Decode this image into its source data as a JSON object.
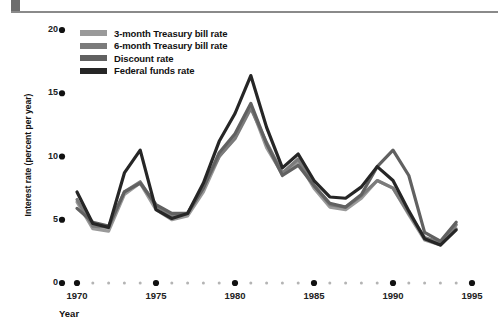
{
  "header": {
    "rule_color": "#8a8a8a",
    "block_color": "#6d6d6d"
  },
  "chart_data": {
    "type": "line",
    "title": "",
    "subtitle": "",
    "xlabel": "Year",
    "ylabel": "Interest rate (percent per year)",
    "xlim": [
      1969,
      1996
    ],
    "ylim": [
      0,
      20
    ],
    "ytick_labels": [
      "0",
      "5",
      "10",
      "15",
      "20"
    ],
    "ytick_values": [
      0,
      5,
      10,
      15,
      20
    ],
    "xtick_labels": [
      "1970",
      "1975",
      "1980",
      "1985",
      "1990",
      "1995"
    ],
    "xtick_values": [
      1970,
      1975,
      1980,
      1985,
      1990,
      1995
    ],
    "minor_xticks": [
      1971,
      1972,
      1973,
      1974,
      1976,
      1977,
      1978,
      1979,
      1981,
      1982,
      1983,
      1984,
      1986,
      1987,
      1988,
      1989,
      1991,
      1992,
      1993,
      1994
    ],
    "grid": false,
    "legend_position": "upper-left",
    "x": [
      1970,
      1971,
      1972,
      1973,
      1974,
      1975,
      1976,
      1977,
      1978,
      1979,
      1980,
      1981,
      1982,
      1983,
      1984,
      1985,
      1986,
      1987,
      1988,
      1989,
      1990,
      1991,
      1992,
      1993,
      1994
    ],
    "series": [
      {
        "name": "3-month Treasury bill rate",
        "color": "#9a9a9a",
        "values": [
          6.4,
          4.3,
          4.1,
          7.0,
          7.9,
          5.8,
          5.0,
          5.3,
          7.2,
          10.0,
          11.5,
          14.0,
          10.7,
          8.6,
          9.6,
          7.5,
          6.0,
          5.8,
          6.7,
          8.1,
          7.5,
          5.4,
          3.4,
          3.0,
          4.3
        ]
      },
      {
        "name": "6-month Treasury bill rate",
        "color": "#7b7b7b",
        "values": [
          6.6,
          4.5,
          4.4,
          7.2,
          8.0,
          6.1,
          5.3,
          5.5,
          7.6,
          10.0,
          11.4,
          13.8,
          11.1,
          8.7,
          9.8,
          7.7,
          6.2,
          6.0,
          6.9,
          8.1,
          7.5,
          5.5,
          3.6,
          3.2,
          4.6
        ]
      },
      {
        "name": "Discount rate",
        "color": "#616161",
        "values": [
          5.9,
          4.8,
          4.5,
          7.2,
          7.9,
          6.2,
          5.5,
          5.5,
          7.5,
          10.3,
          11.8,
          14.2,
          11.0,
          8.5,
          9.3,
          7.7,
          6.3,
          6.0,
          7.0,
          9.2,
          10.5,
          8.5,
          4.0,
          3.3,
          4.8
        ]
      },
      {
        "name": "Federal funds rate",
        "color": "#262626",
        "values": [
          7.2,
          4.7,
          4.4,
          8.7,
          10.5,
          5.8,
          5.1,
          5.5,
          7.9,
          11.2,
          13.4,
          16.4,
          12.3,
          9.1,
          10.2,
          8.1,
          6.8,
          6.7,
          7.6,
          9.2,
          8.1,
          5.7,
          3.5,
          3.0,
          4.2
        ]
      }
    ]
  }
}
